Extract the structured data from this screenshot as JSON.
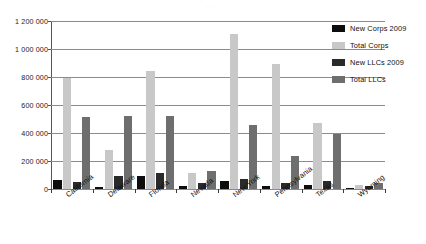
{
  "title_sliver": "· · ·",
  "chart_data": {
    "type": "bar",
    "title": "",
    "xlabel": "",
    "ylabel": "",
    "ylim": [
      0,
      1200000
    ],
    "yticks": [
      0,
      200000,
      400000,
      600000,
      800000,
      1000000,
      1200000
    ],
    "ytick_labels": [
      "0",
      "200 000",
      "400 000",
      "600 000",
      "800 000",
      "1 000 000",
      "1 200 000"
    ],
    "grid": true,
    "legend_position": "right",
    "categories": [
      "California",
      "Delaware",
      "Florida",
      "Nevada",
      "New York",
      "Pennsylvania",
      "Texas",
      "Wyoming"
    ],
    "series": [
      {
        "name": "New Corps 2009",
        "color": "#0d0d0d",
        "values": [
          65000,
          12000,
          95000,
          18000,
          60000,
          22000,
          30000,
          9000
        ]
      },
      {
        "name": "Total Corps",
        "color": "#c8c8c8",
        "values": [
          790000,
          280000,
          845000,
          115000,
          1105000,
          890000,
          470000,
          26000
        ]
      },
      {
        "name": "New LLCs 2009",
        "color": "#2a2a2a",
        "values": [
          50000,
          95000,
          115000,
          40000,
          75000,
          40000,
          55000,
          22000
        ]
      },
      {
        "name": "Total LLCs",
        "color": "#6e6e6e",
        "values": [
          515000,
          525000,
          520000,
          130000,
          460000,
          235000,
          390000,
          40000
        ]
      }
    ]
  }
}
